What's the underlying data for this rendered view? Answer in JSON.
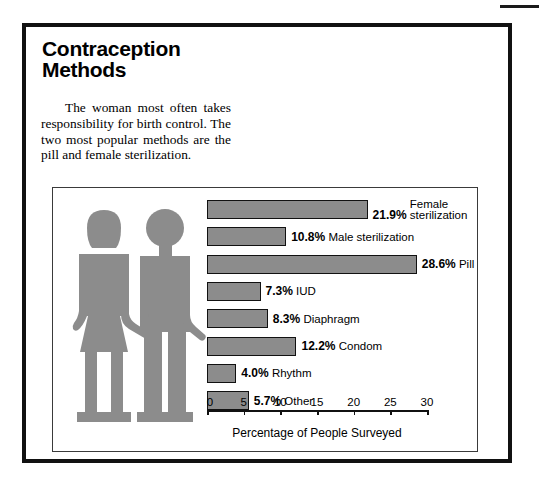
{
  "page": {
    "headline_line1": "Contraception",
    "headline_line2": "Methods",
    "intro": "The woman most often takes responsibility for birth control. The two most popular methods are the pill and female sterilization.",
    "illustration_alt": "woman-and-man-pictogram-holding-hands",
    "figure_color": "#8c8c8c",
    "bar_color": "#8c8c8c",
    "frame_color": "#111111"
  },
  "chart_data": {
    "type": "bar",
    "orientation": "horizontal",
    "title": "Contraception Methods",
    "xlabel": "Percentage of People Surveyed",
    "ylabel": "",
    "xlim": [
      0,
      30
    ],
    "xticks": [
      0,
      5,
      10,
      15,
      20,
      25,
      30
    ],
    "xtick_labels": [
      "0",
      "5",
      "10",
      "15",
      "20",
      "25",
      "30"
    ],
    "grid": false,
    "legend": false,
    "categories": [
      "Female sterilization",
      "Male sterilization",
      "Pill",
      "IUD",
      "Diaphragm",
      "Condom",
      "Rhythm",
      "Other"
    ],
    "values": [
      21.9,
      10.8,
      28.6,
      7.3,
      8.3,
      12.2,
      4.0,
      5.7
    ],
    "value_labels": [
      "21.9%",
      "10.8%",
      "28.6%",
      "7.3%",
      "8.3%",
      "12.2%",
      "4.0%",
      "5.7%"
    ],
    "bars": [
      {
        "label_line1": "Female",
        "label_line2": "sterilization",
        "label": "Female sterilization",
        "value": 21.9,
        "value_label": "21.9%",
        "two_line": true
      },
      {
        "label_line1": "Male sterilization",
        "label_line2": "",
        "label": "Male sterilization",
        "value": 10.8,
        "value_label": "10.8%",
        "two_line": false
      },
      {
        "label_line1": "Pill",
        "label_line2": "",
        "label": "Pill",
        "value": 28.6,
        "value_label": "28.6%",
        "two_line": false
      },
      {
        "label_line1": "IUD",
        "label_line2": "",
        "label": "IUD",
        "value": 7.3,
        "value_label": "7.3%",
        "two_line": false
      },
      {
        "label_line1": "Diaphragm",
        "label_line2": "",
        "label": "Diaphragm",
        "value": 8.3,
        "value_label": "8.3%",
        "two_line": false
      },
      {
        "label_line1": "Condom",
        "label_line2": "",
        "label": "Condom",
        "value": 12.2,
        "value_label": "12.2%",
        "two_line": false
      },
      {
        "label_line1": "Rhythm",
        "label_line2": "",
        "label": "Rhythm",
        "value": 4.0,
        "value_label": "4.0%",
        "two_line": false
      },
      {
        "label_line1": "Other",
        "label_line2": "",
        "label": "Other",
        "value": 5.7,
        "value_label": "5.7%",
        "two_line": false
      }
    ]
  }
}
